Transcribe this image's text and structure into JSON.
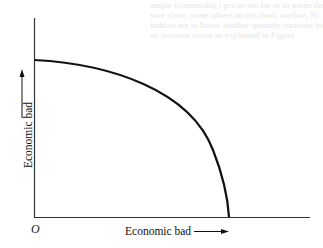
{
  "diagram": {
    "title": "",
    "y_axis_label": "Economic bad",
    "x_axis_label": "Economic bad",
    "origin_label": "O",
    "curve": {
      "shape": "concave-to-origin quarter curve",
      "y_intercept_fraction": 0.79,
      "x_intercept_fraction": 0.71,
      "color": "#111111"
    },
    "axis_color": "#333333"
  },
  "background_text": [
    "ample (commodity) prices are far as to mean that",
    "sure chart, some others in the chart, on-line, Pr",
    "indices are to know another quantity increase interest",
    "an increase curve as explained in Figure"
  ]
}
